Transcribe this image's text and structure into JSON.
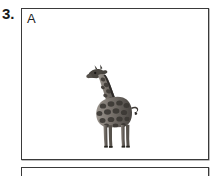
{
  "worksheet": {
    "item_number": "3.",
    "panels": [
      {
        "label": "A",
        "content_icon": "giraffe-illustration",
        "content_description": "giraffe"
      },
      {
        "label": "",
        "content_icon": "",
        "content_description": ""
      }
    ]
  },
  "colors": {
    "border": "#3a3a3a",
    "text": "#1a1a1a",
    "label": "#222222",
    "background": "#ffffff",
    "illustration_dark": "#3d3a37",
    "illustration_mid": "#6b6661",
    "illustration_light": "#a8a29b"
  }
}
